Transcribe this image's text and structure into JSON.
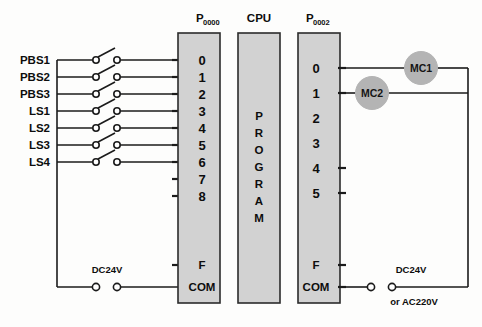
{
  "diagram": {
    "colors": {
      "module_fill": "#d2d2d2",
      "module_stroke": "#2b2b2b",
      "wire": "#1b1b1b",
      "coil_fill": "#b4b4b4",
      "background": "#fdfdfc"
    }
  },
  "headers": {
    "input_module": {
      "prefix": "P",
      "subscript": "0000"
    },
    "cpu": {
      "label": "CPU"
    },
    "output_module": {
      "prefix": "P",
      "subscript": "0002"
    }
  },
  "cpu": {
    "program_letters": [
      "P",
      "R",
      "O",
      "G",
      "R",
      "A",
      "M"
    ],
    "program_text": "PROGRAM"
  },
  "inputs": {
    "devices": [
      {
        "label": "PBS1",
        "terminal": "0"
      },
      {
        "label": "PBS2",
        "terminal": "1"
      },
      {
        "label": "PBS3",
        "terminal": "2"
      },
      {
        "label": "LS1",
        "terminal": "3"
      },
      {
        "label": "LS2",
        "terminal": "4"
      },
      {
        "label": "LS3",
        "terminal": "5"
      },
      {
        "label": "LS4",
        "terminal": "6"
      }
    ],
    "unused_terminals": [
      "7",
      "8"
    ],
    "frame_terminal": "F",
    "common_terminal": "COM",
    "supply_label": "DC24V"
  },
  "outputs": {
    "terminals": [
      {
        "terminal": "0",
        "coil": "MC1",
        "connected": true
      },
      {
        "terminal": "1",
        "coil": "MC2",
        "connected": true
      },
      {
        "terminal": "2",
        "coil": "",
        "connected": false
      },
      {
        "terminal": "3",
        "coil": "",
        "connected": false
      },
      {
        "terminal": "4",
        "coil": "",
        "connected": false
      },
      {
        "terminal": "5",
        "coil": "",
        "connected": false
      }
    ],
    "frame_terminal": "F",
    "common_terminal": "COM",
    "supply_label": "DC24V",
    "supply_alt_label": "or AC220V"
  }
}
